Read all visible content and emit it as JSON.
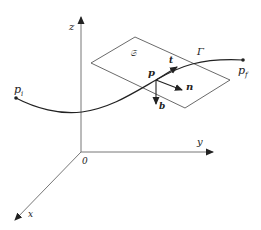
{
  "figure": {
    "type": "frenet-frame-diagram",
    "axes": {
      "x_label": "x",
      "y_label": "y",
      "z_label": "z",
      "origin_label": "0"
    },
    "curve": {
      "name": "Γ",
      "start_label": "p",
      "start_sub": "i",
      "end_label": "p",
      "end_sub": "f"
    },
    "plane_label": "𝔖",
    "point_label": "p",
    "vectors": {
      "tangent": "t",
      "normal": "n",
      "binormal": "b"
    }
  }
}
